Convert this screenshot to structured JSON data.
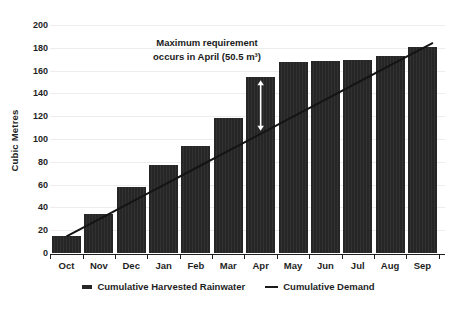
{
  "chart_data": {
    "type": "bar",
    "title": "",
    "xlabel": "",
    "ylabel": "Cubic Metres",
    "categories": [
      "Oct",
      "Nov",
      "Dec",
      "Jan",
      "Feb",
      "Mar",
      "Apr",
      "May",
      "Jun",
      "Jul",
      "Aug",
      "Sep"
    ],
    "series": [
      {
        "name": "Cumulative Harvested Rainwater",
        "type": "bar",
        "color": "#262626",
        "values": [
          15,
          35,
          58,
          78,
          94,
          119,
          155,
          168,
          169,
          170,
          173,
          181
        ]
      },
      {
        "name": "Cumulative Demand",
        "type": "line",
        "color": "#141414",
        "values": [
          15,
          30,
          45,
          60,
          75,
          90,
          105,
          120,
          135,
          150,
          165,
          180
        ]
      }
    ],
    "ylim": [
      0,
      200
    ],
    "ytick_interval": 20,
    "grid": true,
    "legend_position": "bottom",
    "annotation": {
      "line1": "Maximum requirement",
      "line2": "occurs in April (50.5 m³)",
      "arrow_month": "Apr",
      "arrow_from_value": 155,
      "arrow_to_value": 105,
      "arrow_color": "#ffffff"
    },
    "colors": {
      "grid": "#ededed",
      "axis": "#1f1f1f",
      "text": "#1f1f1f",
      "background": "#ffffff"
    }
  }
}
